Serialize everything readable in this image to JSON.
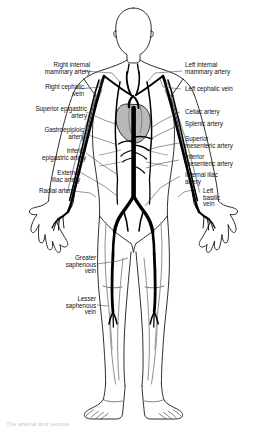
{
  "figure": {
    "view": "anterior full-body schematic",
    "background_color": "#ffffff",
    "outline_color": "#1a1a1a",
    "vessel_dark_color": "#000000",
    "vessel_light_color": "#8f8f8f",
    "heart_fill_color": "#b9b9b9",
    "label_color": "#111111",
    "leader_color": "#333333"
  },
  "labels_left": [
    {
      "id": "right-internal-mammary-artery",
      "text": "Right internal\nmammary artery"
    },
    {
      "id": "right-cephalic-vein",
      "text": "Right cephalic\nvein"
    },
    {
      "id": "superior-epigastric-artery",
      "text": "Superior epigastric\nartery"
    },
    {
      "id": "gastroepiploic-artery",
      "text": "Gastroepiploic\nartery"
    },
    {
      "id": "inferior-epigastric-artery",
      "text": "Inferior\nepigastric artery"
    },
    {
      "id": "external-iliac-artery",
      "text": "External\niliac artery"
    },
    {
      "id": "radial-artery",
      "text": "Radial artery"
    },
    {
      "id": "greater-saphenous-vein",
      "text": "Greater\nsaphenous\nvein"
    },
    {
      "id": "lesser-saphenous-vein",
      "text": "Lesser\nsaphenous\nvein"
    }
  ],
  "labels_right": [
    {
      "id": "left-internal-mammary-artery",
      "text": "Left internal\nmammary artery"
    },
    {
      "id": "left-cephalic-vein",
      "text": "Left cephalic vein"
    },
    {
      "id": "celiac-artery",
      "text": "Celiac artery"
    },
    {
      "id": "splenic-artery",
      "text": "Splenic artery"
    },
    {
      "id": "superior-mesenteric-artery",
      "text": "Superior\nmesenteric artery"
    },
    {
      "id": "inferior-mesenteric-artery",
      "text": "Inferior\nmesenteric artery"
    },
    {
      "id": "internal-iliac-artery",
      "text": "Internal iliac\nartery"
    },
    {
      "id": "left-basilic-vein",
      "text": "Left\nbasilic\nvein"
    }
  ],
  "caption": {
    "text": "The arterial and venous"
  }
}
